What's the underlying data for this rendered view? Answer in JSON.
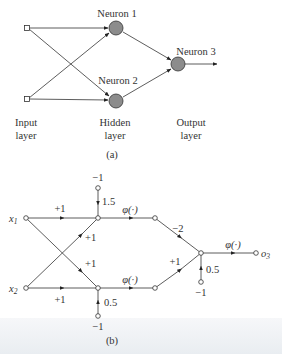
{
  "figure_a": {
    "neurons": [
      {
        "label": "Neuron 1"
      },
      {
        "label": "Neuron 2"
      },
      {
        "label": "Neuron 3"
      }
    ],
    "layers": [
      {
        "line1": "Input",
        "line2": "layer"
      },
      {
        "line1": "Hidden",
        "line2": "layer"
      },
      {
        "line1": "Output",
        "line2": "layer"
      }
    ],
    "caption": "(a)",
    "neuron_fill": "#8c8c8c"
  },
  "figure_b": {
    "inputs": {
      "x1": "x",
      "x1_sub": "1",
      "x2": "x",
      "x2_sub": "2"
    },
    "output": {
      "label": "o",
      "sub": "3"
    },
    "weights": {
      "x1_to_h1": "+1",
      "x2_to_h1": "+1",
      "x1_to_h2": "+1",
      "x2_to_h2": "+1",
      "h1_to_o": "−2",
      "h2_to_o": "+1"
    },
    "biases": {
      "h1_input": "−1",
      "h1_weight": "1.5",
      "h2_input": "−1",
      "h2_weight": "0.5",
      "o_input": "−1",
      "o_weight": "0.5"
    },
    "activation": "φ(·)",
    "caption": "(b)"
  }
}
